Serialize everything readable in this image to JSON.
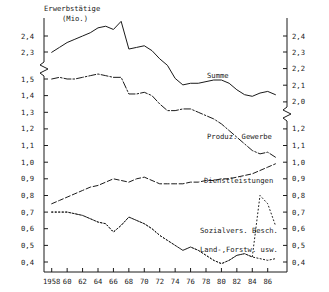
{
  "chart_data": {
    "type": "line",
    "title": "Erwerbstätige",
    "subtitle": "(Mio.)",
    "xlabel": "",
    "ylabel": "Erwerbstätige (Mio.)",
    "grid": false,
    "legend": "inline-annotations",
    "axis_break": true,
    "x": [
      1958,
      1959,
      1960,
      1961,
      1962,
      1963,
      1964,
      1965,
      1966,
      1967,
      1968,
      1969,
      1970,
      1971,
      1972,
      1973,
      1974,
      1975,
      1976,
      1977,
      1978,
      1979,
      1980,
      1981,
      1982,
      1983,
      1984,
      1985,
      1986,
      1987
    ],
    "xticklabels": [
      "1958",
      "60",
      "62",
      "64",
      "66",
      "68",
      "70",
      "72",
      "74",
      "76",
      "78",
      "80",
      "82",
      "84",
      "86"
    ],
    "xtickvalues": [
      1958,
      1960,
      1962,
      1964,
      1966,
      1968,
      1970,
      1972,
      1974,
      1976,
      1978,
      1980,
      1982,
      1984,
      1986
    ],
    "xlim": [
      1957.0,
      1988.5
    ],
    "y_upper_ticks": [
      2.0,
      2.1,
      2.2,
      2.3,
      2.4
    ],
    "y_lower_ticks": [
      0.4,
      0.5,
      0.6,
      0.7,
      0.8,
      0.9,
      1.0,
      1.1,
      1.2,
      1.3,
      1.4,
      1.5
    ],
    "y_upper_ticklabels": [
      "2,0",
      "2,1",
      "2,2",
      "2,3",
      "2,4"
    ],
    "y_lower_ticklabels": [
      "0,4",
      "0,5",
      "0,6",
      "0,7",
      "0,8",
      "0,9",
      "1,0",
      "1,1",
      "1,2",
      "1,3",
      "1,4",
      "1,5"
    ],
    "y_right_upper_ticklabels": [
      "2,0",
      "2,1",
      "2,2",
      "2,3",
      "2,4"
    ],
    "y_right_lower_ticklabels": [
      "0,4",
      "0,5",
      "0,6",
      "0,7",
      "0,8",
      "0,9",
      "1,0",
      "1,1",
      "1,2"
    ],
    "series": [
      {
        "name": "Summe",
        "style": "solid",
        "axis": "upper",
        "label": "Summe",
        "values": [
          2.3,
          2.33,
          2.36,
          2.38,
          2.4,
          2.42,
          2.45,
          2.46,
          2.44,
          2.49,
          2.32,
          2.33,
          2.34,
          2.31,
          2.26,
          2.22,
          2.14,
          2.1,
          2.11,
          2.11,
          2.12,
          2.13,
          2.13,
          2.11,
          2.07,
          2.04,
          2.03,
          2.05,
          2.06,
          2.04
        ]
      },
      {
        "name": "Produz. Gewerbe",
        "style": "dashdot",
        "axis": "lower",
        "label": "Produz. Gewerbe",
        "values": [
          1.5,
          1.51,
          1.5,
          1.5,
          1.51,
          1.52,
          1.53,
          1.52,
          1.51,
          1.51,
          1.41,
          1.41,
          1.42,
          1.4,
          1.35,
          1.31,
          1.31,
          1.32,
          1.32,
          1.3,
          1.28,
          1.26,
          1.23,
          1.19,
          1.15,
          1.11,
          1.07,
          1.05,
          1.06,
          1.03
        ]
      },
      {
        "name": "Dienstleistungen",
        "style": "dashed",
        "axis": "lower",
        "label": "Dienstleistungen",
        "values": [
          0.75,
          0.77,
          0.79,
          0.81,
          0.83,
          0.85,
          0.86,
          0.88,
          0.9,
          0.89,
          0.88,
          0.9,
          0.91,
          0.89,
          0.87,
          0.87,
          0.87,
          0.87,
          0.88,
          0.88,
          0.89,
          0.89,
          0.9,
          0.9,
          0.91,
          0.92,
          0.93,
          0.95,
          0.97,
          0.99
        ]
      },
      {
        "name": "Sozialvers. Besch.",
        "style": "dotted-fine",
        "axis": "lower",
        "label": "Sozialvers. Besch.",
        "values": [
          0.7,
          0.7,
          0.7,
          0.69,
          0.68,
          0.66,
          0.64,
          0.63,
          0.58,
          0.62,
          0.67,
          0.65,
          0.63,
          0.6,
          0.56,
          0.53,
          0.5,
          0.47,
          0.49,
          0.47,
          0.44,
          0.41,
          0.39,
          0.41,
          0.44,
          0.45,
          0.43,
          0.8,
          0.75,
          0.62
        ]
      },
      {
        "name": "Land-/Forstw. usw.",
        "style": "dotted",
        "axis": "lower",
        "label": "Land-,Forstw. usw.",
        "values": [
          0.7,
          0.7,
          0.7,
          0.69,
          0.68,
          0.66,
          0.64,
          0.63,
          0.58,
          0.62,
          0.67,
          0.65,
          0.63,
          0.6,
          0.56,
          0.53,
          0.5,
          0.47,
          0.49,
          0.47,
          0.44,
          0.41,
          0.39,
          0.41,
          0.44,
          0.45,
          0.43,
          0.42,
          0.41,
          0.42
        ]
      }
    ]
  },
  "annotations": {
    "summe": "Summe",
    "produz": "Produz. Gewerbe",
    "dienst": "Dienstleistungen",
    "sozial": "Sozialvers. Besch.",
    "land": "Land-,Forstw. usw."
  },
  "axis_titles": {
    "main": "Erwerbstätige",
    "unit": "(Mio.)"
  },
  "colors": {
    "ink": "#1a1a1a",
    "background": "#ffffff"
  }
}
